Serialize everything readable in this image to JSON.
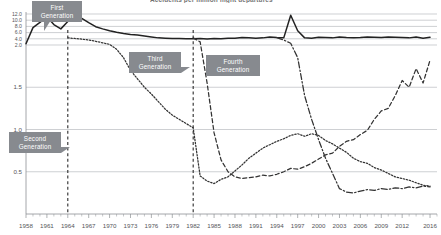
{
  "chart_data": {
    "type": "line",
    "title": "Accidents per million flight departures",
    "xlabel": "",
    "ylabel": "",
    "grid": true,
    "legend_position": "none",
    "axis_note": "broken y-axis: compressed band 2.0-12.0 at top, linear 0-2.0 below",
    "xlim": [
      1958,
      2017
    ],
    "ylim": [
      0,
      12
    ],
    "x_ticks": [
      1958,
      1961,
      1964,
      1967,
      1970,
      1973,
      1976,
      1979,
      1982,
      1985,
      1988,
      1991,
      1994,
      1997,
      2000,
      2003,
      2006,
      2009,
      2012,
      2016
    ],
    "y_ticks_lower": [
      0.5,
      1.0,
      1.5
    ],
    "y_ticks_compressed": [
      2.0,
      4.0,
      6.0,
      8.0,
      10.0,
      12.0
    ],
    "vertical_markers": [
      1964,
      1982
    ],
    "series": [
      {
        "name": "First Generation",
        "style": "solid",
        "color": "#222222",
        "x": [
          1958,
          1959,
          1960,
          1961,
          1962,
          1963,
          1964,
          1965,
          1966,
          1967,
          1968,
          1969,
          1970,
          1971,
          1972,
          1973,
          1974,
          1975,
          1976,
          1977,
          1978,
          1979,
          1980,
          1981,
          1982,
          1983,
          1984,
          1985,
          1986,
          1987,
          1988,
          1989,
          1990,
          1991,
          1992,
          1993,
          1994,
          1995,
          1996,
          1997,
          1998,
          1999,
          2000,
          2001,
          2002,
          2003,
          2004,
          2005,
          2006,
          2007,
          2008,
          2009,
          2010,
          2011,
          2012,
          2013,
          2014,
          2015,
          2016
        ],
        "values": [
          2.4,
          7.6,
          9.3,
          11.1,
          8.6,
          7.2,
          9.6,
          11.0,
          10.6,
          9.2,
          7.9,
          7.2,
          6.6,
          6.1,
          5.7,
          5.4,
          5.2,
          4.9,
          4.6,
          4.3,
          4.2,
          4.1,
          4.1,
          4.0,
          4.0,
          4.1,
          3.9,
          4.1,
          4.0,
          4.2,
          4.2,
          4.4,
          4.3,
          4.2,
          4.3,
          4.6,
          4.4,
          4.3,
          11.6,
          6.6,
          4.3,
          4.2,
          4.5,
          4.4,
          4.3,
          4.6,
          4.4,
          4.3,
          4.4,
          4.6,
          4.5,
          4.4,
          4.6,
          4.5,
          4.4,
          4.3,
          4.6,
          4.2,
          4.5
        ]
      },
      {
        "name": "Second Generation",
        "style": "dotted",
        "color": "#333333",
        "x": [
          1964,
          1965,
          1966,
          1967,
          1968,
          1969,
          1970,
          1971,
          1972,
          1973,
          1974,
          1975,
          1976,
          1977,
          1978,
          1979,
          1980,
          1981,
          1982,
          1983,
          1984,
          1985,
          1986,
          1987,
          1988,
          1989,
          1990,
          1991,
          1992,
          1993,
          1994,
          1995,
          1996,
          1997,
          1998,
          1999,
          2000,
          2001,
          2002,
          2003,
          2004,
          2005,
          2006,
          2007,
          2008,
          2009,
          2010,
          2011,
          2012,
          2013,
          2014,
          2015,
          2016
        ],
        "values": [
          4.3,
          4.1,
          3.9,
          3.6,
          3.2,
          2.7,
          2.2,
          1.95,
          1.85,
          1.7,
          1.6,
          1.5,
          1.42,
          1.33,
          1.24,
          1.17,
          1.12,
          1.07,
          1.02,
          0.45,
          0.39,
          0.36,
          0.41,
          0.44,
          0.51,
          0.58,
          0.66,
          0.72,
          0.78,
          0.82,
          0.86,
          0.89,
          0.93,
          0.95,
          0.92,
          0.95,
          0.93,
          0.87,
          0.83,
          0.78,
          0.73,
          0.66,
          0.62,
          0.6,
          0.55,
          0.52,
          0.48,
          0.44,
          0.42,
          0.4,
          0.37,
          0.34,
          0.33
        ]
      },
      {
        "name": "Third Generation",
        "style": "dashed",
        "color": "#333333",
        "x": [
          1982,
          1983,
          1984,
          1985,
          1986,
          1987,
          1988,
          1989,
          1990,
          1991,
          1992,
          1993,
          1994,
          1995,
          1996,
          1997,
          1998,
          1999,
          2000,
          2001,
          2002,
          2003,
          2004,
          2005,
          2006,
          2007,
          2008,
          2009,
          2010,
          2011,
          2012,
          2013,
          2014,
          2015,
          2016
        ],
        "values": [
          4.3,
          3.0,
          1.55,
          0.96,
          0.64,
          0.5,
          0.44,
          0.42,
          0.43,
          0.44,
          0.46,
          0.45,
          0.47,
          0.5,
          0.54,
          0.53,
          0.56,
          0.6,
          0.65,
          0.7,
          0.72,
          0.8,
          0.86,
          0.88,
          0.94,
          0.99,
          1.12,
          1.22,
          1.25,
          1.4,
          1.58,
          1.5,
          1.72,
          1.55,
          1.82
        ]
      },
      {
        "name": "Fourth Generation",
        "style": "dashdot",
        "color": "#333333",
        "x": [
          1994,
          1995,
          1996,
          1997,
          1998,
          1999,
          2000,
          2001,
          2002,
          2003,
          2004,
          2005,
          2006,
          2007,
          2008,
          2009,
          2010,
          2011,
          2012,
          2013,
          2014,
          2015,
          2016
        ],
        "values": [
          4.4,
          3.6,
          2.55,
          1.85,
          1.4,
          1.12,
          0.88,
          0.66,
          0.48,
          0.3,
          0.26,
          0.25,
          0.27,
          0.29,
          0.28,
          0.3,
          0.29,
          0.31,
          0.3,
          0.32,
          0.31,
          0.33,
          0.32
        ]
      }
    ],
    "annotations": [
      {
        "label_line1": "First",
        "label_line2": "Generation"
      },
      {
        "label_line1": "Second",
        "label_line2": "Generation"
      },
      {
        "label_line1": "Third",
        "label_line2": "Generation"
      },
      {
        "label_line1": "Fourth",
        "label_line2": "Generation"
      }
    ]
  },
  "annotation_colors": {
    "callout_bg": "#878a8f",
    "callout_text": "#ffffff",
    "gridline": "#b9bcc0",
    "axis": "#8d9094"
  }
}
